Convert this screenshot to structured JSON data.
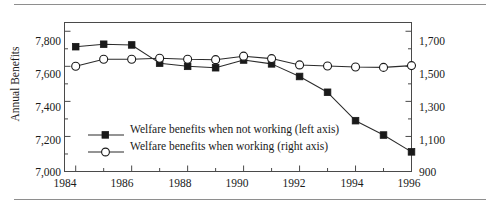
{
  "figure": {
    "axis_title_left": "Annual Benefits",
    "has_top_rule": true,
    "has_bottom_rule": true
  },
  "legend": {
    "entries": [
      {
        "label": "Welfare benefits when not working (left axis)",
        "marker": "filled-square",
        "axis": "left"
      },
      {
        "label": "Welfare benefits when working (right axis)",
        "marker": "open-circle",
        "axis": "right"
      }
    ]
  },
  "axes": {
    "left_ticks": [
      "7,800",
      "7,600",
      "7,400",
      "7,200",
      "7,000"
    ],
    "right_ticks": [
      "1,700",
      "1,500",
      "1,300",
      "1,100",
      "900"
    ],
    "x_ticks": [
      "1984",
      "1986",
      "1988",
      "1990",
      "1992",
      "1994",
      "1996"
    ]
  },
  "chart_data": {
    "type": "line",
    "title": "",
    "xlabel": "",
    "ylabel": "Annual Benefits",
    "ylabel_right": "",
    "x": [
      1984,
      1985,
      1986,
      1987,
      1988,
      1989,
      1990,
      1991,
      1992,
      1993,
      1994,
      1995,
      1996
    ],
    "xlim": [
      1983.6,
      1996
    ],
    "ylim": [
      7000,
      7850
    ],
    "ylim_right": [
      900,
      1750
    ],
    "grid": false,
    "legend_position": "inside-lower-left",
    "series": [
      {
        "name": "Welfare benefits when not working (left axis)",
        "axis": "left",
        "marker": "filled-square",
        "values": [
          7712,
          7726,
          7722,
          7618,
          7600,
          7592,
          7636,
          7614,
          7542,
          7452,
          7290,
          7208,
          7112
        ]
      },
      {
        "name": "Welfare benefits when working (right axis)",
        "axis": "right",
        "marker": "open-circle",
        "values": [
          1500,
          1540,
          1540,
          1546,
          1540,
          1538,
          1558,
          1544,
          1508,
          1502,
          1496,
          1494,
          1504
        ]
      }
    ]
  }
}
